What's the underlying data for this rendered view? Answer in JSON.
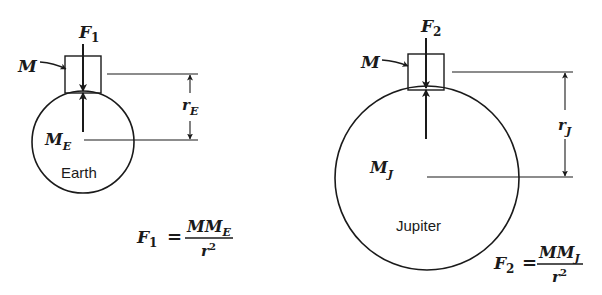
{
  "figure": {
    "earth": {
      "planet_label": "Earth",
      "mass_label": {
        "main": "M",
        "sub": "E"
      },
      "test_mass_label": "M",
      "force_label": {
        "main": "F",
        "sub": "1"
      },
      "radius_label": {
        "main": "r",
        "sub": "E"
      },
      "formula": {
        "lhs_main": "F",
        "lhs_sub": "1",
        "equals": "=",
        "numerator_main": "MM",
        "numerator_sub": "E",
        "denominator_main": "r",
        "denominator_sup": "2"
      }
    },
    "jupiter": {
      "planet_label": "Jupiter",
      "mass_label": {
        "main": "M",
        "sub": "J"
      },
      "test_mass_label": "M",
      "force_label": {
        "main": "F",
        "sub": "2"
      },
      "radius_label": {
        "main": "r",
        "sub": "J"
      },
      "formula": {
        "lhs_main": "F",
        "lhs_sub": "2",
        "equals": "=",
        "numerator_main": "MM",
        "numerator_sub": "J",
        "denominator_main": "r",
        "denominator_sup": "2"
      }
    }
  }
}
